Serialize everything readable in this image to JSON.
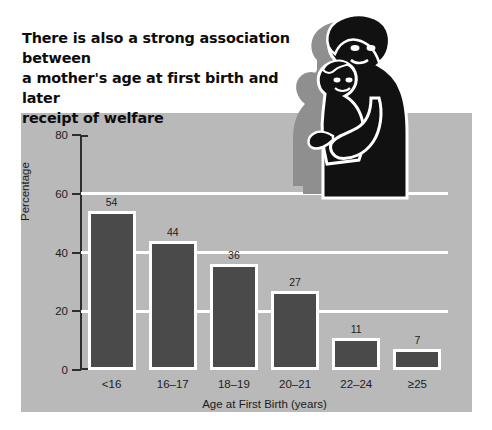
{
  "headline": "There is also a strong association between\na mother's age at first birth and later\nreceipt of welfare",
  "colors": {
    "panel_background": "#b9b9b9",
    "bar_fill": "#4a4a4a",
    "bar_outline": "#ffffff",
    "gridline": "#ffffff",
    "axis": "#2e2e2e",
    "text": "#1c1c1c",
    "headline_text": "#0d0d0d",
    "page_background": "#ffffff",
    "illustration_fill": "#111111",
    "illustration_shadow": "#8f8f8f",
    "illustration_outline": "#ffffff"
  },
  "illustration": {
    "name": "mother-holding-baby-illustration",
    "description": "Silhouette of a mother holding a baby"
  },
  "chart_data": {
    "type": "bar",
    "title": "There is also a strong association between a mother's age at first birth and later receipt of welfare",
    "xlabel": "Age at First Birth (years)",
    "ylabel": "Percentage",
    "categories": [
      "<16",
      "16–17",
      "18–19",
      "20–21",
      "22–24",
      "≥25"
    ],
    "values": [
      54,
      44,
      36,
      27,
      11,
      7
    ],
    "ylim": [
      0,
      80
    ],
    "yticks": [
      0,
      20,
      40,
      60,
      80
    ],
    "ytick_labels": [
      "0",
      "20",
      "40",
      "60",
      "80"
    ],
    "gridlines": [
      20,
      40,
      60
    ],
    "grid": true,
    "legend": false
  }
}
